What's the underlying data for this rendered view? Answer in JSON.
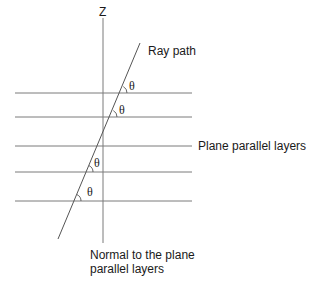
{
  "diagram": {
    "axis_label": "Z",
    "ray_label": "Ray path",
    "layers_label": "Plane parallel layers",
    "normal_label_line1": "Normal to the plane",
    "normal_label_line2": "parallel layers",
    "angle_symbol": "θ",
    "layer_count": 5,
    "colors": {
      "lines": "#7a7a7a",
      "text": "#1a1a1a",
      "background": "#ffffff"
    }
  }
}
